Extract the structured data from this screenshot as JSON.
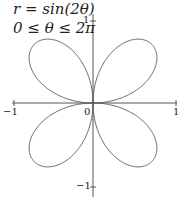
{
  "chart_data": {
    "type": "line",
    "subtype": "polar-parametric",
    "title": "r = sin(2θ)",
    "subtitle": "0 ≤ θ ≤ 2π",
    "equation": "r = sin(2θ)",
    "domain": "0 ≤ θ ≤ 2π",
    "theta_range": [
      0,
      6.283185
    ],
    "xlabel": "",
    "ylabel": "",
    "xlim": [
      -1,
      1
    ],
    "ylim": [
      -1,
      1
    ],
    "x_ticks": [
      -1,
      0,
      1
    ],
    "y_ticks": [
      -1,
      1
    ],
    "tick_labels": {
      "x_neg": "−1",
      "origin": "0",
      "x_pos": "1",
      "y_pos": "1",
      "y_neg": "−1"
    },
    "grid": false,
    "legend": null,
    "series": [
      {
        "name": "r = sin(2θ)",
        "color": "#555555",
        "petals": 4,
        "petal_tips": [
          [
            0.5,
            0.5
          ],
          [
            -0.5,
            0.5
          ],
          [
            -0.5,
            -0.5
          ],
          [
            0.5,
            -0.5
          ]
        ]
      }
    ]
  },
  "labels": {
    "title_line1": "r = sin(2θ)",
    "title_line2": "0 ≤ θ ≤ 2π",
    "x_neg": "−1",
    "origin": "0",
    "x_pos": "1",
    "y_pos": "1",
    "y_neg": "−1"
  },
  "layout": {
    "origin_px": [
      93,
      103
    ],
    "unit_px": 83,
    "axis_color": "#444444",
    "curve_color": "#555555"
  }
}
